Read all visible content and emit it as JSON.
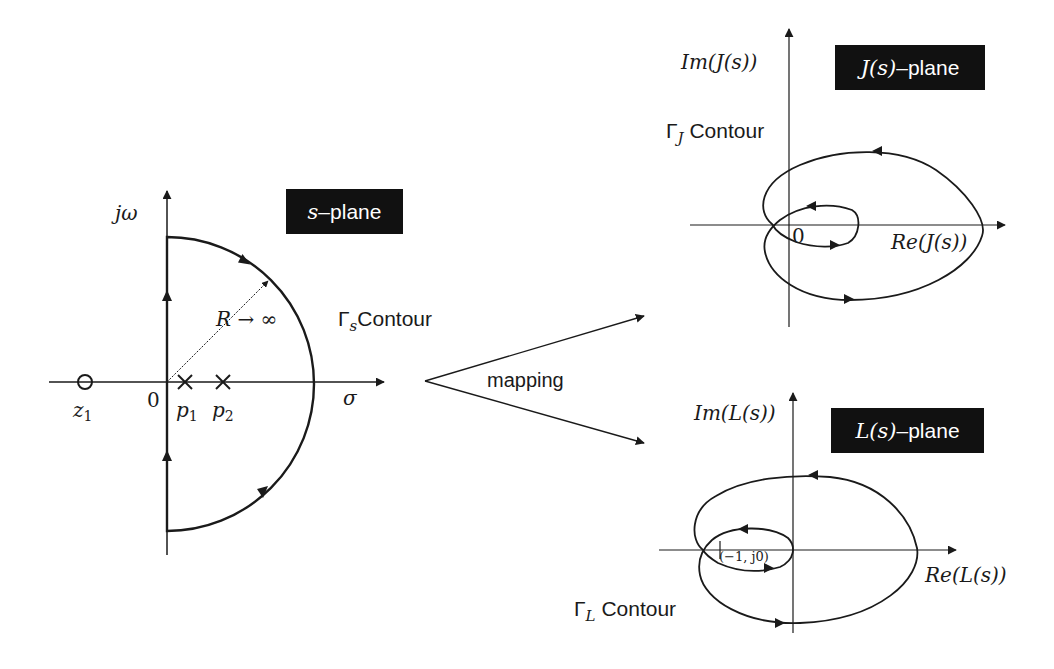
{
  "colors": {
    "background": "#ffffff",
    "line": "#1a1a1a",
    "label_box": "#111111",
    "label_box_text": "#ffffff"
  },
  "s_plane": {
    "title_var": "s",
    "title_suffix": "–plane",
    "y_axis_label": "jω",
    "x_axis_label": "σ",
    "origin_label": "0",
    "zero_label": "z",
    "zero_sub": "1",
    "pole1_label": "p",
    "pole1_sub": "1",
    "pole2_label": "p",
    "pole2_sub": "2",
    "radius_label": "R → ∞",
    "contour_gamma": "Γ",
    "contour_sub": "s",
    "contour_text": "Contour"
  },
  "mapping": {
    "label": "mapping"
  },
  "j_plane": {
    "title_var": "J(s)",
    "title_suffix": "–plane",
    "y_axis_label": "Im(J(s))",
    "x_axis_label": "Re(J(s))",
    "origin_label": "0",
    "contour_gamma": "Γ",
    "contour_sub": "J",
    "contour_text": "Contour"
  },
  "l_plane": {
    "title_var": "L(s)",
    "title_suffix": "–plane",
    "y_axis_label": "Im(L(s))",
    "x_axis_label": "Re(L(s))",
    "critical_point_label": "(−1, j0)",
    "contour_gamma": "Γ",
    "contour_sub": "L",
    "contour_text": "Contour"
  }
}
